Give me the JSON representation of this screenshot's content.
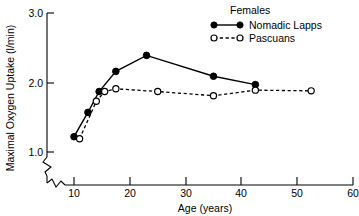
{
  "chart_data": {
    "type": "line",
    "title": "",
    "xlabel": "Age (years)",
    "ylabel": "Maximal Oxygen Uptake (l/min)",
    "xlim": [
      3,
      60
    ],
    "ylim": [
      0.72,
      3.0
    ],
    "xticks": [
      10,
      20,
      30,
      40,
      50,
      60
    ],
    "xtick_labels": [
      "10",
      "20",
      "30",
      "40",
      "50",
      "60"
    ],
    "yticks": [
      1.0,
      2.0,
      3.0
    ],
    "ytick_labels": [
      "1.0",
      "2.0",
      "3.0"
    ],
    "grid": false,
    "axis_break_x": true,
    "axis_break_y": true,
    "legend_position": "top-right",
    "legend_title": "Females",
    "series": [
      {
        "name": "Nomadic Lapps",
        "marker": "filled-circle",
        "line": "solid",
        "color": "#000000",
        "x": [
          10,
          12.5,
          14.5,
          17.5,
          23,
          35,
          42.5
        ],
        "y": [
          1.22,
          1.57,
          1.87,
          2.16,
          2.39,
          2.09,
          1.97
        ]
      },
      {
        "name": "Pascuans",
        "marker": "open-circle",
        "line": "dashed",
        "color": "#000000",
        "x": [
          11,
          14,
          15.5,
          17.5,
          25,
          35,
          42.5,
          52.5
        ],
        "y": [
          1.19,
          1.73,
          1.87,
          1.91,
          1.87,
          1.81,
          1.89,
          1.88
        ]
      }
    ]
  },
  "axes": {
    "x_title": "Age (years)",
    "y_title": "Maximal Oxygen Uptake (l/min)"
  },
  "legend": {
    "title": "Females",
    "entries": [
      {
        "label": "Nomadic Lapps",
        "marker": "filled-circle",
        "line": "solid"
      },
      {
        "label": "Pascuans",
        "marker": "open-circle",
        "line": "dashed"
      }
    ]
  },
  "ticks": {
    "x": [
      "10",
      "20",
      "30",
      "40",
      "50",
      "60"
    ],
    "y": [
      "1.0",
      "2.0",
      "3.0"
    ]
  }
}
